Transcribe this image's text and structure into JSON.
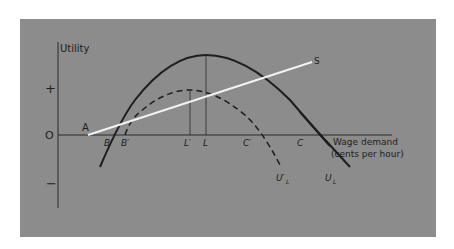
{
  "diagram": {
    "type": "economic-utility-diagram",
    "y_axis_label": "Utility",
    "x_axis_label_line1": "Wage demand",
    "x_axis_label_line2": "(cents per hour)",
    "plus_sign": "+",
    "minus_sign": "−",
    "origin_label": "O",
    "point_labels": {
      "A": "A",
      "B": "B",
      "B_prime": "B′",
      "L_prime": "L′",
      "L": "L",
      "C_prime": "C′",
      "C": "C",
      "S": "S"
    },
    "curve_labels": {
      "UL": "U",
      "UL_sub": "L",
      "UL_prime": "U′",
      "UL_prime_sub": "L"
    },
    "colors": {
      "background": "#8c8c8c",
      "curves": "#1e1e1e",
      "line_S": "#f2f2f2"
    }
  }
}
